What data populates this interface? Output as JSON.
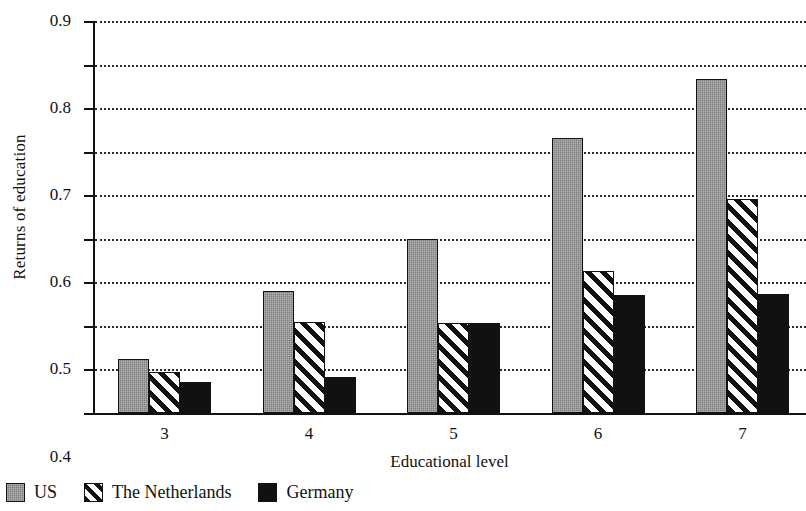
{
  "chart_data": {
    "type": "bar",
    "title": "",
    "xlabel": "Educational level",
    "ylabel": "Returns of education",
    "categories": [
      "3",
      "4",
      "5",
      "6",
      "7"
    ],
    "series": [
      {
        "name": "US",
        "color": "#808080",
        "pattern": "solid-gray",
        "values": [
          0.125,
          0.281,
          0.4,
          0.632,
          0.766
        ]
      },
      {
        "name": "The Netherlands",
        "color": "#ffffff",
        "pattern": "diagonal-hatch",
        "values": [
          0.095,
          0.208,
          0.207,
          0.325,
          0.492
        ]
      },
      {
        "name": "Germany",
        "color": "#111111",
        "pattern": "solid-black",
        "values": [
          0.071,
          0.083,
          0.207,
          0.271,
          0.273
        ]
      }
    ],
    "ylim": [
      0.0,
      0.9
    ],
    "ytick_labels": [
      "0.0",
      "0.1",
      "0.2",
      "0.3",
      "0.4",
      "0.5",
      "0.6",
      "0.7",
      "0.8",
      "0.9"
    ],
    "ytick_values": [
      0.0,
      0.1,
      0.2,
      0.3,
      0.4,
      0.5,
      0.6,
      0.7,
      0.8,
      0.9
    ],
    "grid": true,
    "grid_style": "dotted-horizontal",
    "legend_position": "below-left",
    "legend": [
      "US",
      "The Netherlands",
      "Germany"
    ]
  },
  "axes": {
    "y_title": "Returns of education",
    "x_title": "Educational level"
  },
  "legend": {
    "items": [
      {
        "label": "US",
        "swatch": "us"
      },
      {
        "label": "The Netherlands",
        "swatch": "nl"
      },
      {
        "label": "Germany",
        "swatch": "de"
      }
    ]
  }
}
